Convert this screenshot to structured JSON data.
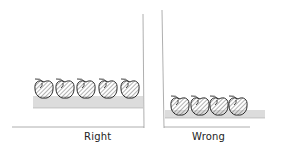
{
  "figure": {
    "type": "hand-drawn comparison sketch",
    "panels": [
      {
        "id": "right",
        "label": "Right",
        "apple_count": 5,
        "description": "apples sit on top of a tall grass/hatched strip, touching the right wall"
      },
      {
        "id": "wrong",
        "label": "Wrong",
        "apple_count": 4,
        "description": "apples sit low, nearly on the floor line, on a thin hatched strip"
      }
    ]
  },
  "colors": {
    "ink": "#2a2a2a",
    "hatch": "#555555",
    "line": "#9a9a9a",
    "background": "#ffffff"
  }
}
